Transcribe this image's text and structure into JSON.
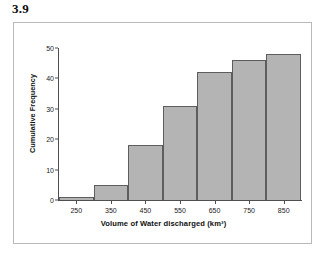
{
  "figure": {
    "label": "3.9"
  },
  "chart_data": {
    "type": "bar",
    "title": "3.9",
    "xlabel": "Volume of Water discharged (km³)",
    "ylabel": "Cumulative Frequency",
    "categories": [
      "250",
      "350",
      "450",
      "550",
      "650",
      "750",
      "850"
    ],
    "values": [
      1,
      5,
      18,
      31,
      42,
      46,
      48
    ],
    "x_ticks": [
      "250",
      "350",
      "450",
      "550",
      "650",
      "750",
      "850"
    ],
    "y_ticks": [
      "0",
      "10",
      "20",
      "30",
      "40",
      "50"
    ],
    "ylim": [
      0,
      50
    ],
    "xlim": [
      200,
      900
    ],
    "bin_width": 100,
    "grid": false,
    "legend": false,
    "bar_color": "#b4b4b4",
    "bar_edge_color": "#5d5d5d",
    "axis_color": "#4f4f4f",
    "frame_color": "#b9b9b9",
    "background": "#ffffff"
  }
}
